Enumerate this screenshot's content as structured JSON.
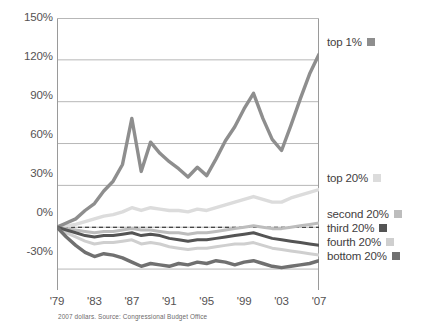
{
  "chart_data": {
    "type": "line",
    "title": "",
    "xlabel": "",
    "ylabel": "",
    "source_note": "2007 dollars. Source: Congressional Budget Office",
    "grid": true,
    "legend_position": "right",
    "xlim": [
      1979,
      2007
    ],
    "ylim": [
      -45,
      150
    ],
    "yticks": [
      150,
      120,
      90,
      60,
      30,
      0,
      -30
    ],
    "ytick_labels": [
      "150%",
      "120%",
      "90%",
      "60%",
      "30%",
      "0%",
      "-30%"
    ],
    "xticks": [
      1979,
      1983,
      1987,
      1991,
      1995,
      1999,
      2003,
      2007
    ],
    "xtick_labels": [
      "'79",
      "'83",
      "'87",
      "'91",
      "'95",
      "'99",
      "'03",
      "'07"
    ],
    "x": [
      1979,
      1980,
      1981,
      1982,
      1983,
      1984,
      1985,
      1986,
      1987,
      1988,
      1989,
      1990,
      1991,
      1992,
      1993,
      1994,
      1995,
      1996,
      1997,
      1998,
      1999,
      2000,
      2001,
      2002,
      2003,
      2004,
      2005,
      2006,
      2007
    ],
    "zero_line": 0,
    "zero_line_style": "dashed",
    "series": [
      {
        "name": "top 1%",
        "color": "#8e8e8e",
        "width": 3.4,
        "values": [
          0,
          3,
          6,
          12,
          17,
          26,
          33,
          45,
          78,
          40,
          61,
          53,
          47,
          42,
          36,
          43,
          37,
          49,
          62,
          72,
          85,
          96,
          78,
          63,
          55,
          73,
          92,
          110,
          124
        ]
      },
      {
        "name": "top 20%",
        "color": "#dcdcdc",
        "width": 3.4,
        "values": [
          0,
          1,
          2,
          4,
          6,
          8,
          9,
          11,
          14,
          12,
          14,
          13,
          12,
          12,
          11,
          13,
          12,
          14,
          16,
          18,
          20,
          22,
          20,
          18,
          18,
          21,
          23,
          25,
          27
        ]
      },
      {
        "name": "second 20%",
        "color": "#bdbdbd",
        "width": 3.0,
        "values": [
          0,
          -1,
          -2,
          -3,
          -4,
          -3,
          -3,
          -2,
          -1,
          -2,
          -2,
          -3,
          -4,
          -4,
          -5,
          -4,
          -4,
          -3,
          -2,
          -1,
          0,
          1,
          0,
          -1,
          -1,
          0,
          1,
          2,
          3
        ]
      },
      {
        "name": "third 20%",
        "color": "#545454",
        "width": 3.0,
        "values": [
          0,
          -2,
          -4,
          -6,
          -7,
          -6,
          -6,
          -5,
          -4,
          -6,
          -5,
          -6,
          -8,
          -9,
          -10,
          -9,
          -9,
          -8,
          -7,
          -6,
          -5,
          -4,
          -6,
          -8,
          -9,
          -10,
          -11,
          -12,
          -13
        ]
      },
      {
        "name": "fourth 20%",
        "color": "#cfcfcf",
        "width": 3.0,
        "values": [
          0,
          -4,
          -7,
          -10,
          -12,
          -11,
          -11,
          -10,
          -9,
          -12,
          -11,
          -12,
          -14,
          -15,
          -16,
          -15,
          -15,
          -14,
          -13,
          -12,
          -12,
          -11,
          -13,
          -15,
          -16,
          -17,
          -18,
          -19,
          -20
        ]
      },
      {
        "name": "bottom 20%",
        "color": "#707070",
        "width": 3.4,
        "values": [
          0,
          -7,
          -13,
          -18,
          -21,
          -19,
          -20,
          -22,
          -25,
          -28,
          -26,
          -27,
          -28,
          -26,
          -27,
          -25,
          -26,
          -24,
          -25,
          -27,
          -25,
          -24,
          -26,
          -28,
          -29,
          -28,
          -27,
          -26,
          -24
        ]
      }
    ]
  },
  "legend": {
    "entries": [
      {
        "label": "top 1%",
        "swatch": "#8e8e8e",
        "top": 36,
        "left": 327
      },
      {
        "label": "top 20%",
        "swatch": "#dcdcdc",
        "top": 172,
        "left": 327
      },
      {
        "label": "second 20%",
        "swatch": "#bdbdbd",
        "top": 208,
        "left": 327
      },
      {
        "label": "third 20%",
        "swatch": "#545454",
        "top": 222,
        "left": 327
      },
      {
        "label": "fourth 20%",
        "swatch": "#cfcfcf",
        "top": 236,
        "left": 327
      },
      {
        "label": "bottom 20%",
        "swatch": "#707070",
        "top": 250,
        "left": 327
      }
    ]
  },
  "axis": {
    "y_label_positions": [
      18,
      57,
      96,
      135,
      174,
      213,
      252
    ],
    "x_label_positions": [
      0,
      37.43,
      74.86,
      112.29,
      149.71,
      187.14,
      224.57,
      262
    ]
  },
  "colors": {
    "grid": "#b7b7b7",
    "frame": "#9a9a9a",
    "text": "#555253",
    "legend_text": "#3f3d3e",
    "source_text": "#6d6a6b",
    "background": "#ffffff"
  }
}
